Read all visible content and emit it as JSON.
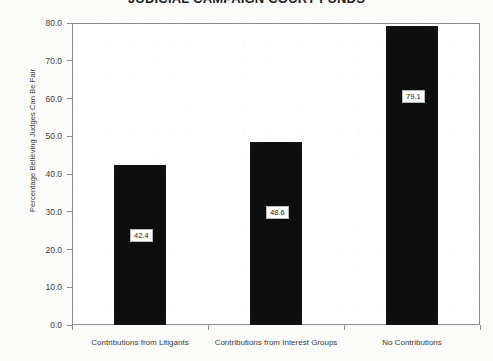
{
  "chart_data": {
    "type": "bar",
    "title": "JUDICIAL CAMPAIGN COURT FUNDS",
    "categories": [
      "Contributions from Litigants",
      "Contributions from Interest Groups",
      "No Contributions"
    ],
    "values": [
      42.4,
      48.6,
      79.1
    ],
    "value_labels": [
      "42.4",
      "48.6",
      "79.1"
    ],
    "xlabel": "",
    "ylabel": "Percentage Believing Judges Can Be Fair",
    "ylim": [
      0.0,
      80.0
    ],
    "ytick_labels": [
      "0.0",
      "10.0",
      "20.0",
      "30.0",
      "40.0",
      "50.0",
      "60.0",
      "70.0",
      "80.0"
    ],
    "ytick_values": [
      0,
      10,
      20,
      30,
      40,
      50,
      60,
      70,
      80
    ],
    "grid": false,
    "legend": "none",
    "bar_color": "#0d0d0d",
    "frame_color": "#8d8d8d",
    "background_color": "#fbfbf9",
    "plot_background_color": "#ffffff"
  }
}
